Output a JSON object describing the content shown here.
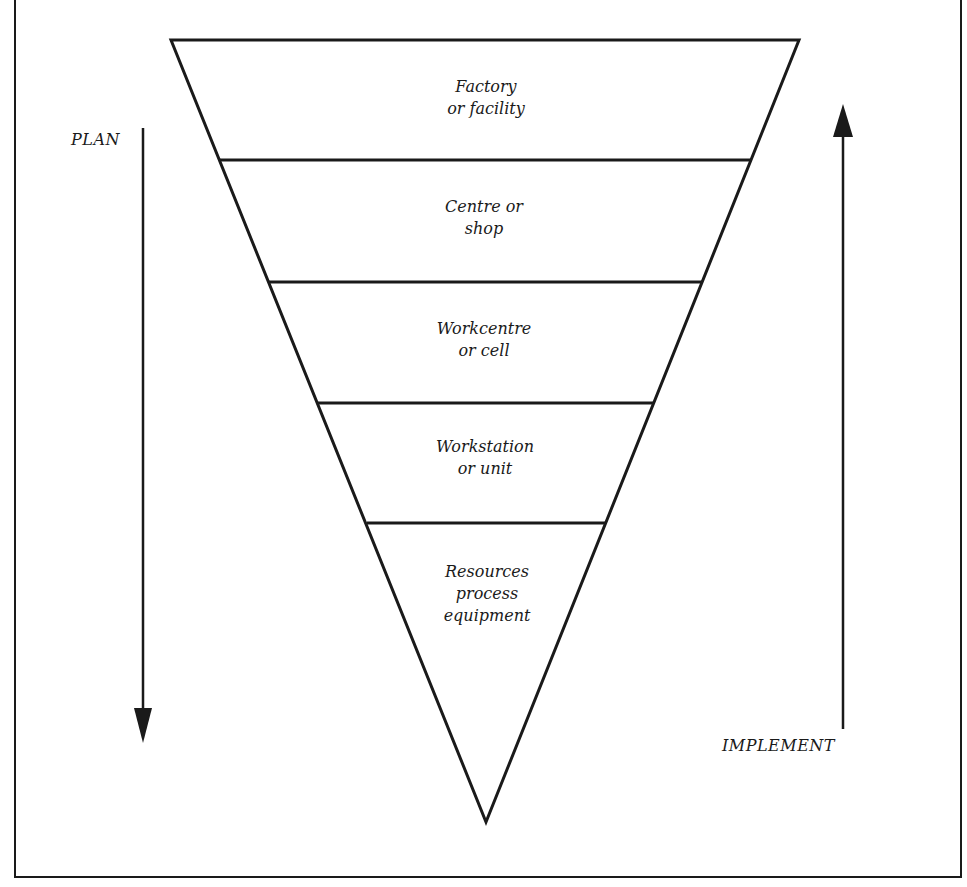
{
  "diagram": {
    "type": "inverted-pyramid",
    "levels": [
      {
        "line1": "Factory",
        "line2": "or facility",
        "line3": ""
      },
      {
        "line1": "Centre or",
        "line2": "shop",
        "line3": ""
      },
      {
        "line1": "Workcentre",
        "line2": "or cell",
        "line3": ""
      },
      {
        "line1": "Workstation",
        "line2": "or unit",
        "line3": ""
      },
      {
        "line1": "Resources",
        "line2": "process",
        "line3": "equipment"
      }
    ],
    "left_arrow": {
      "label": "PLAN",
      "direction": "down"
    },
    "right_arrow": {
      "label": "IMPLEMENT",
      "direction": "up"
    },
    "colors": {
      "ink": "#1a1a1a",
      "background": "#ffffff"
    }
  }
}
